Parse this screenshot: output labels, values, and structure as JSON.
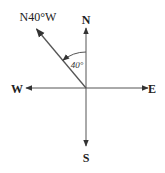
{
  "diagram": {
    "type": "compass-bearing",
    "directions": {
      "north": "N",
      "south": "S",
      "east": "E",
      "west": "W"
    },
    "bearing_label": "N40°W",
    "angle_label": "40°",
    "bearing_degrees_from_north_toward_west": 40,
    "colors": {
      "lines": "#555555",
      "text": "#222222"
    }
  }
}
